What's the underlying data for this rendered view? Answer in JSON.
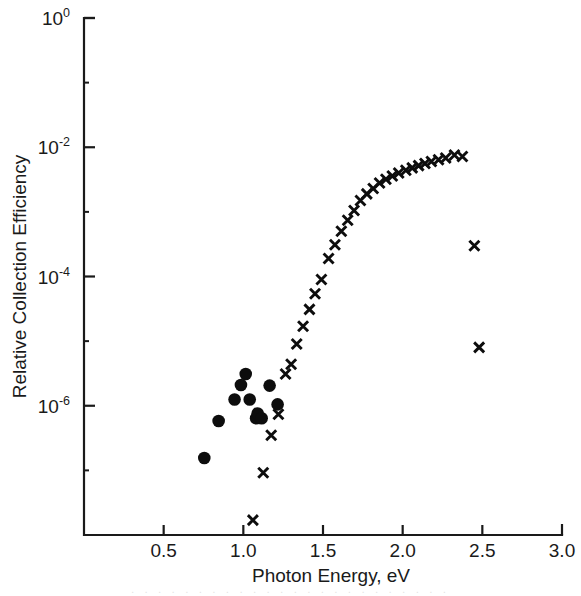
{
  "figure": {
    "caption_ghost": ". . . . . . . . . . . . . . . . . . . . . . . ."
  },
  "chart_data": {
    "type": "scatter",
    "title": "",
    "subtitle": "",
    "xlabel": "Photon Energy, eV",
    "ylabel": "Relative Collection Efficiency",
    "xscale": "linear",
    "yscale": "log",
    "xlim": [
      0.0,
      3.0
    ],
    "ylim": [
      1e-08,
      1.0
    ],
    "grid": false,
    "legend": "none",
    "xticks": [
      0.0,
      0.5,
      1.0,
      1.5,
      2.0,
      2.5,
      3.0
    ],
    "xticklabels": [
      "",
      "0.5",
      "1.0",
      "1.5",
      "2.0",
      "2.5",
      "3.0"
    ],
    "yticks": [
      1.0,
      0.01,
      0.0001,
      1e-06
    ],
    "yticklabels": [
      "10^0",
      "10^-2",
      "10^-4",
      "10^-6"
    ],
    "ytick_mantissa": [
      "10",
      "10",
      "10",
      "10"
    ],
    "ytick_exponents": [
      "0",
      "-2",
      "-4",
      "-6"
    ],
    "yminor_ticks": [
      0.1,
      0.001,
      1e-05,
      1e-07
    ],
    "series": [
      {
        "name": "filled-circles",
        "marker": "circle",
        "color": "#0d0d0d",
        "points": [
          {
            "x": 0.755,
            "y": 1.55e-07
          },
          {
            "x": 0.845,
            "y": 5.8e-07
          },
          {
            "x": 0.945,
            "y": 1.25e-06
          },
          {
            "x": 0.985,
            "y": 2.1e-06
          },
          {
            "x": 1.015,
            "y": 3.1e-06
          },
          {
            "x": 1.04,
            "y": 1.25e-06
          },
          {
            "x": 1.08,
            "y": 6.4e-07
          },
          {
            "x": 1.09,
            "y": 7.6e-07
          },
          {
            "x": 1.115,
            "y": 6.4e-07
          },
          {
            "x": 1.165,
            "y": 2.05e-06
          },
          {
            "x": 1.215,
            "y": 1.05e-06
          }
        ]
      },
      {
        "name": "cross-markers",
        "marker": "x",
        "color": "#0d0d0d",
        "points": [
          {
            "x": 1.06,
            "y": 1.7e-08
          },
          {
            "x": 1.125,
            "y": 9.2e-08
          },
          {
            "x": 1.175,
            "y": 3.5e-07
          },
          {
            "x": 1.22,
            "y": 7.4e-07
          },
          {
            "x": 1.265,
            "y": 3.1e-06
          },
          {
            "x": 1.3,
            "y": 4.4e-06
          },
          {
            "x": 1.335,
            "y": 9e-06
          },
          {
            "x": 1.375,
            "y": 1.7e-05
          },
          {
            "x": 1.415,
            "y": 3.1e-05
          },
          {
            "x": 1.45,
            "y": 5.4e-05
          },
          {
            "x": 1.49,
            "y": 9e-05
          },
          {
            "x": 1.535,
            "y": 0.00019
          },
          {
            "x": 1.575,
            "y": 0.00031
          },
          {
            "x": 1.615,
            "y": 0.0005
          },
          {
            "x": 1.655,
            "y": 0.00074
          },
          {
            "x": 1.695,
            "y": 0.00105
          },
          {
            "x": 1.735,
            "y": 0.0015
          },
          {
            "x": 1.775,
            "y": 0.0019
          },
          {
            "x": 1.815,
            "y": 0.0023
          },
          {
            "x": 1.855,
            "y": 0.0028
          },
          {
            "x": 1.895,
            "y": 0.0032
          },
          {
            "x": 1.935,
            "y": 0.0036
          },
          {
            "x": 1.975,
            "y": 0.004
          },
          {
            "x": 2.02,
            "y": 0.0044
          },
          {
            "x": 2.06,
            "y": 0.0048
          },
          {
            "x": 2.1,
            "y": 0.0052
          },
          {
            "x": 2.14,
            "y": 0.0056
          },
          {
            "x": 2.18,
            "y": 0.006
          },
          {
            "x": 2.225,
            "y": 0.0064
          },
          {
            "x": 2.27,
            "y": 0.0068
          },
          {
            "x": 2.325,
            "y": 0.0076
          },
          {
            "x": 2.375,
            "y": 0.0072
          },
          {
            "x": 2.45,
            "y": 0.0003
          },
          {
            "x": 2.48,
            "y": 8e-06
          }
        ]
      }
    ]
  }
}
